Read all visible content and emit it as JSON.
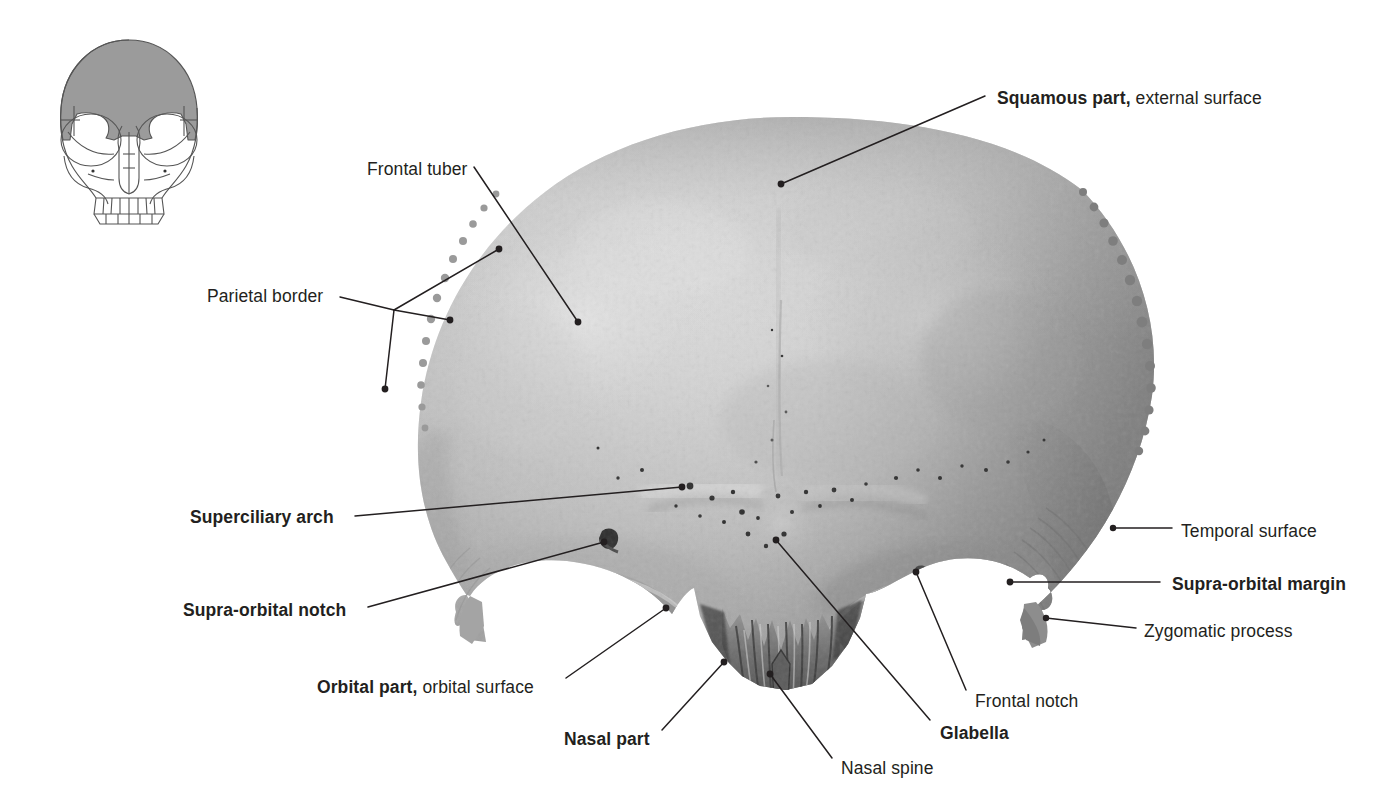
{
  "figure": {
    "view": "anterior view",
    "bone_tone_light": "#d2d2d2",
    "bone_tone_mid": "#b4b4b4",
    "bone_tone_dark": "#8a8a8a",
    "leader_color": "#231f20",
    "background": "#ffffff"
  },
  "orientation_key": {
    "name": "skull-anterior-orientation-diagram",
    "outline_color": "#555555",
    "highlight_color": "#9b9b9b",
    "highlight_region": "frontal bone"
  },
  "labels": [
    {
      "id": "squamous-part",
      "bold_text": "Squamous part,",
      "plain_text": " external surface",
      "align": "left",
      "x": 997,
      "y": 88
    },
    {
      "id": "frontal-tuber",
      "bold_text": "",
      "plain_text": "Frontal tuber",
      "align": "left",
      "x": 367,
      "y": 159
    },
    {
      "id": "parietal-border",
      "bold_text": "",
      "plain_text": "Parietal border",
      "align": "left",
      "x": 207,
      "y": 286
    },
    {
      "id": "superciliary-arch",
      "bold_text": "Superciliary arch",
      "plain_text": "",
      "align": "left",
      "x": 190,
      "y": 507
    },
    {
      "id": "supra-orbital-notch",
      "bold_text": "Supra-orbital notch",
      "plain_text": "",
      "align": "left",
      "x": 183,
      "y": 600
    },
    {
      "id": "orbital-part",
      "bold_text": "Orbital part,",
      "plain_text": " orbital surface",
      "align": "left",
      "x": 317,
      "y": 677
    },
    {
      "id": "nasal-part",
      "bold_text": "Nasal part",
      "plain_text": "",
      "align": "left",
      "x": 564,
      "y": 729
    },
    {
      "id": "nasal-spine",
      "bold_text": "",
      "plain_text": "Nasal spine",
      "align": "left",
      "x": 841,
      "y": 758
    },
    {
      "id": "glabella",
      "bold_text": "Glabella",
      "plain_text": "",
      "align": "left",
      "x": 940,
      "y": 723
    },
    {
      "id": "frontal-notch",
      "bold_text": "",
      "plain_text": "Frontal notch",
      "align": "left",
      "x": 975,
      "y": 691
    },
    {
      "id": "temporal-surface",
      "bold_text": "",
      "plain_text": "Temporal surface",
      "align": "left",
      "x": 1181,
      "y": 521
    },
    {
      "id": "supra-orbital-margin",
      "bold_text": "Supra-orbital margin",
      "plain_text": "",
      "align": "left",
      "x": 1172,
      "y": 574
    },
    {
      "id": "zygomatic-process",
      "bold_text": "",
      "plain_text": "Zygomatic process",
      "align": "left",
      "x": 1144,
      "y": 621
    }
  ]
}
